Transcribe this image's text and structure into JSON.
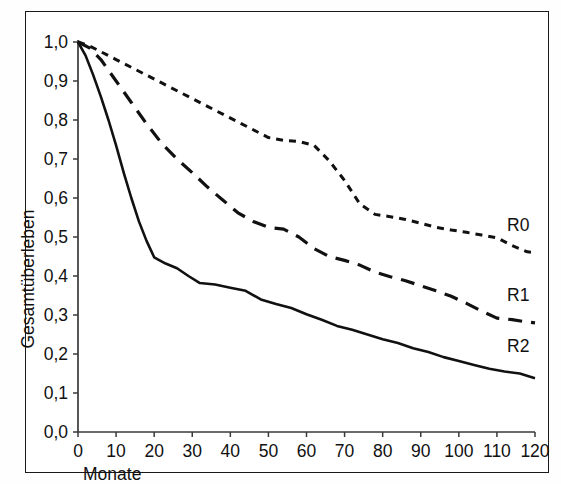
{
  "figure": {
    "frame_color": "#1a1a1a",
    "background": "#ffffff"
  },
  "axis": {
    "y_title": "Gesamtüberleben",
    "x_title": "Monate",
    "y_ticks": [
      "1,0",
      "0,9",
      "0,8",
      "0,7",
      "0,6",
      "0,5",
      "0,4",
      "0,3",
      "0,2",
      "0,1",
      "0,0"
    ],
    "x_ticks": [
      "0",
      "10",
      "20",
      "30",
      "40",
      "50",
      "60",
      "70",
      "80",
      "90",
      "100",
      "110",
      "120"
    ]
  },
  "labels": {
    "r0": "R0",
    "r1": "R1",
    "r2": "R2"
  },
  "chart_data": {
    "type": "line",
    "title": "",
    "subtitle": "",
    "xlabel": "Monate",
    "ylabel": "Gesamtüberleben",
    "xlim": [
      0,
      120
    ],
    "ylim": [
      0.0,
      1.0
    ],
    "xticks": [
      0,
      10,
      20,
      30,
      40,
      50,
      60,
      70,
      80,
      90,
      100,
      110,
      120
    ],
    "yticks": [
      0.0,
      0.1,
      0.2,
      0.3,
      0.4,
      0.5,
      0.6,
      0.7,
      0.8,
      0.9,
      1.0
    ],
    "decimal_separator": ",",
    "grid": false,
    "legend": "inline-right-end-of-curve",
    "annotations": [
      "R0",
      "R1",
      "R2"
    ],
    "series": [
      {
        "name": "R0",
        "linestyle": "dotted-short-dash",
        "color": "#111111",
        "end_value": 0.46,
        "x": [
          0,
          3,
          6,
          10,
          14,
          18,
          22,
          26,
          30,
          34,
          38,
          42,
          46,
          50,
          54,
          58,
          62,
          66,
          70,
          74,
          78,
          82,
          86,
          90,
          94,
          98,
          102,
          106,
          110,
          114,
          118,
          120
        ],
        "y": [
          1.0,
          0.99,
          0.975,
          0.955,
          0.935,
          0.915,
          0.895,
          0.875,
          0.855,
          0.835,
          0.815,
          0.795,
          0.775,
          0.755,
          0.748,
          0.745,
          0.735,
          0.695,
          0.645,
          0.585,
          0.558,
          0.552,
          0.545,
          0.535,
          0.525,
          0.518,
          0.512,
          0.505,
          0.498,
          0.478,
          0.462,
          0.46
        ]
      },
      {
        "name": "R1",
        "linestyle": "long-dash",
        "color": "#111111",
        "end_value": 0.28,
        "x": [
          0,
          3,
          6,
          10,
          14,
          18,
          22,
          26,
          30,
          34,
          38,
          42,
          46,
          50,
          54,
          58,
          62,
          66,
          70,
          74,
          78,
          82,
          86,
          90,
          94,
          98,
          102,
          106,
          110,
          114,
          118,
          120
        ],
        "y": [
          1.0,
          0.985,
          0.955,
          0.9,
          0.845,
          0.79,
          0.74,
          0.7,
          0.665,
          0.628,
          0.595,
          0.562,
          0.54,
          0.525,
          0.52,
          0.5,
          0.47,
          0.45,
          0.44,
          0.428,
          0.41,
          0.398,
          0.388,
          0.375,
          0.362,
          0.348,
          0.33,
          0.31,
          0.292,
          0.288,
          0.282,
          0.28
        ]
      },
      {
        "name": "R2",
        "linestyle": "solid",
        "color": "#111111",
        "end_value": 0.14,
        "x": [
          0,
          2,
          4,
          6,
          8,
          10,
          12,
          14,
          16,
          18,
          20,
          23,
          26,
          29,
          32,
          36,
          40,
          44,
          48,
          52,
          56,
          60,
          64,
          68,
          72,
          76,
          80,
          84,
          88,
          92,
          96,
          100,
          104,
          108,
          112,
          116,
          120
        ],
        "y": [
          1.0,
          0.965,
          0.915,
          0.86,
          0.8,
          0.735,
          0.665,
          0.6,
          0.54,
          0.49,
          0.448,
          0.432,
          0.42,
          0.4,
          0.382,
          0.378,
          0.37,
          0.362,
          0.34,
          0.328,
          0.318,
          0.302,
          0.288,
          0.272,
          0.262,
          0.25,
          0.238,
          0.228,
          0.215,
          0.205,
          0.192,
          0.182,
          0.172,
          0.162,
          0.155,
          0.15,
          0.138
        ]
      }
    ]
  }
}
